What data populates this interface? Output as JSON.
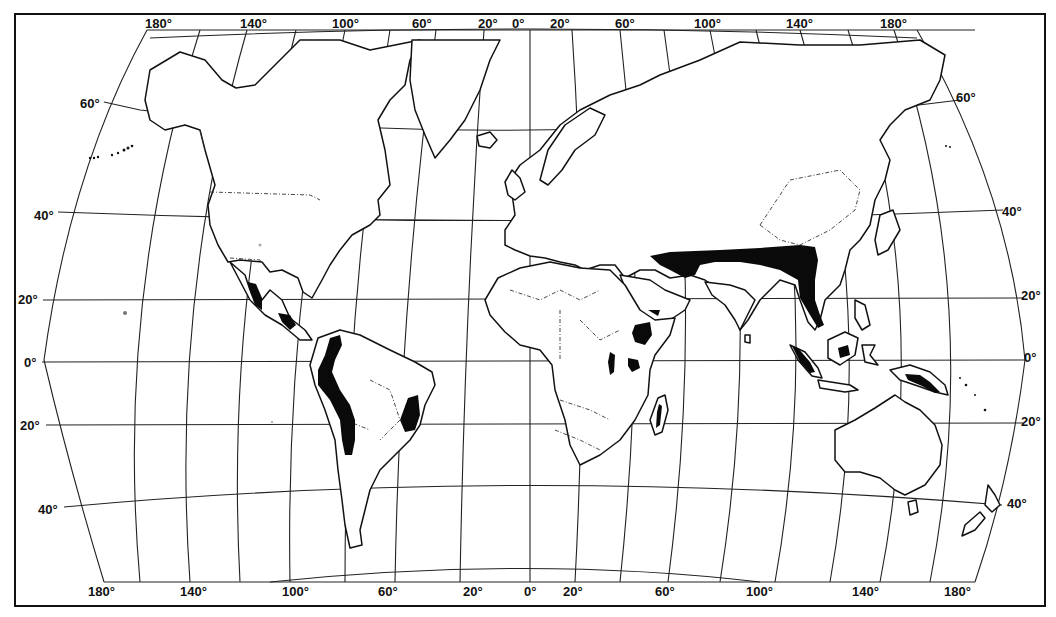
{
  "map": {
    "type": "world outline map (equal-area projection, highland regions shaded)",
    "colors": {
      "background": "#ffffff",
      "ink": "#111111",
      "shaded": "#0a0a0a"
    },
    "labels": {
      "top": [
        {
          "text": "180°",
          "x": 145,
          "y": 16
        },
        {
          "text": "140°",
          "x": 240,
          "y": 16
        },
        {
          "text": "100°",
          "x": 332,
          "y": 16
        },
        {
          "text": "60°",
          "x": 412,
          "y": 16
        },
        {
          "text": "20°",
          "x": 478,
          "y": 16
        },
        {
          "text": "0°",
          "x": 512,
          "y": 16
        },
        {
          "text": "20°",
          "x": 550,
          "y": 16
        },
        {
          "text": "60°",
          "x": 615,
          "y": 16
        },
        {
          "text": "100°",
          "x": 694,
          "y": 16
        },
        {
          "text": "140°",
          "x": 786,
          "y": 16
        },
        {
          "text": "180°",
          "x": 880,
          "y": 16
        }
      ],
      "bottom": [
        {
          "text": "180°",
          "x": 88,
          "y": 584
        },
        {
          "text": "140°",
          "x": 180,
          "y": 584
        },
        {
          "text": "100°",
          "x": 282,
          "y": 584
        },
        {
          "text": "60°",
          "x": 378,
          "y": 584
        },
        {
          "text": "20°",
          "x": 463,
          "y": 584
        },
        {
          "text": "0°",
          "x": 524,
          "y": 584
        },
        {
          "text": "20°",
          "x": 563,
          "y": 584
        },
        {
          "text": "60°",
          "x": 655,
          "y": 584
        },
        {
          "text": "100°",
          "x": 746,
          "y": 584
        },
        {
          "text": "140°",
          "x": 852,
          "y": 584
        },
        {
          "text": "180°",
          "x": 944,
          "y": 584
        }
      ],
      "left": [
        {
          "text": "60°",
          "x": 80,
          "y": 96
        },
        {
          "text": "40°",
          "x": 34,
          "y": 208
        },
        {
          "text": "20°",
          "x": 18,
          "y": 292
        },
        {
          "text": "0°",
          "x": 24,
          "y": 355
        },
        {
          "text": "20°",
          "x": 20,
          "y": 418
        },
        {
          "text": "40°",
          "x": 38,
          "y": 502
        }
      ],
      "right": [
        {
          "text": "60°",
          "x": 956,
          "y": 90
        },
        {
          "text": "40°",
          "x": 1002,
          "y": 204
        },
        {
          "text": "20°",
          "x": 1021,
          "y": 288
        },
        {
          "text": "0°",
          "x": 1024,
          "y": 350
        },
        {
          "text": "20°",
          "x": 1021,
          "y": 414
        },
        {
          "text": "40°",
          "x": 1007,
          "y": 496
        }
      ]
    },
    "shaded_regions": [
      "Sierra Madre (Mexico)",
      "Central American highlands",
      "Andes",
      "Brazilian Highlands",
      "Ethiopian Highlands",
      "Yemen highlands",
      "East African highlands",
      "Madagascar highlands",
      "Himalaya / Tibetan Plateau to Indochina",
      "Sumatra",
      "Borneo",
      "New Guinea highlands"
    ]
  }
}
